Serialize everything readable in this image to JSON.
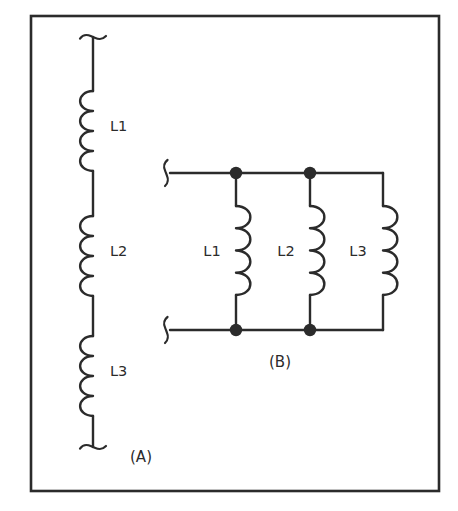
{
  "figure": {
    "name": "inductor-connection-diagram",
    "background_color": "#ffffff",
    "ink_color": "#2b2b2b",
    "frame": {
      "name": "outer-border",
      "x": 31,
      "y": 16,
      "width": 408,
      "height": 475,
      "stroke_width": 2.6,
      "color": "#2b2b2b"
    }
  },
  "circuit_a": {
    "caption": "(A)",
    "caption_x": 141,
    "caption_y": 462,
    "type": "series",
    "axis_x": 93,
    "terminal_top_y": 37,
    "terminal_bottom_y": 447,
    "coil_bulge": "left",
    "coil_loops": 4,
    "inductors": [
      {
        "label": "L1",
        "label_x": 110,
        "label_y": 131,
        "coil_top": 91,
        "coil_bottom": 171
      },
      {
        "label": "L2",
        "label_x": 110,
        "label_y": 256,
        "coil_top": 216,
        "coil_bottom": 296
      },
      {
        "label": "L3",
        "label_x": 110,
        "label_y": 376,
        "coil_top": 336,
        "coil_bottom": 416
      }
    ]
  },
  "circuit_b": {
    "caption": "(B)",
    "caption_x": 280,
    "caption_y": 367,
    "type": "parallel",
    "rail_top_y": 173,
    "rail_bottom_y": 330,
    "rail_left_x": 170,
    "rail_right_x": 383,
    "terminal_top": {
      "name": "terminal-break-top-left",
      "x": 166,
      "y": 173
    },
    "terminal_bottom": {
      "name": "terminal-break-bottom-left",
      "x": 166,
      "y": 330
    },
    "coil_bulge": "right",
    "coil_loops": 4,
    "coil_top": 206,
    "coil_bottom": 295,
    "junction_dot_radius": 6.2,
    "branches": [
      {
        "label": "L1",
        "wire_x": 236,
        "label_x": 212,
        "label_y": 256,
        "has_top_dot": true,
        "has_bottom_dot": true
      },
      {
        "label": "L2",
        "wire_x": 310,
        "label_x": 286,
        "label_y": 256,
        "has_top_dot": true,
        "has_bottom_dot": true
      },
      {
        "label": "L3",
        "wire_x": 383,
        "label_x": 358,
        "label_y": 256,
        "has_top_dot": false,
        "has_bottom_dot": false
      }
    ]
  }
}
